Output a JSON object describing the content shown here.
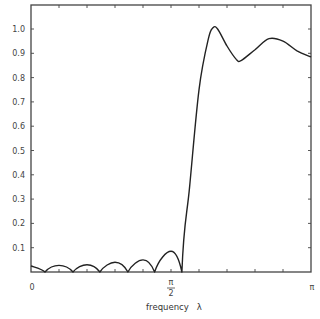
{
  "chart_data": {
    "type": "line",
    "title": "",
    "xlabel": "frequency λ",
    "ylabel": "",
    "xlim": [
      0,
      3.14159
    ],
    "ylim": [
      0,
      1.1
    ],
    "grid": false,
    "legend": null,
    "x_tick_labels": [
      {
        "value": 0,
        "label": "0"
      },
      {
        "value": 1.5708,
        "label": "π/2"
      },
      {
        "value": 3.14159,
        "label": "π"
      }
    ],
    "x_minor_ticks": 10,
    "y_ticks": [
      0.1,
      0.2,
      0.3,
      0.4,
      0.5,
      0.6,
      0.7,
      0.8,
      0.9,
      1.0
    ],
    "y_tick_labels": [
      "0.1",
      "0.2",
      "0.3",
      "0.4",
      "0.5",
      "0.6",
      "0.7",
      "0.8",
      "0.9",
      "1.0"
    ],
    "series": [
      {
        "name": "filter frequency response",
        "x": [
          0,
          0.157,
          0.314,
          0.471,
          0.628,
          0.773,
          0.942,
          1.087,
          1.257,
          1.387,
          1.571,
          1.693,
          1.78,
          1.885,
          1.99,
          2.042,
          2.094,
          2.199,
          2.304,
          2.356,
          2.513,
          2.67,
          2.827,
          2.985,
          3.1416
        ],
        "y": [
          0.025,
          0.0,
          0.027,
          0.0,
          0.03,
          0.0,
          0.04,
          0.0,
          0.05,
          0.0,
          0.085,
          0.0,
          0.35,
          0.75,
          0.96,
          1.005,
          1.0,
          0.93,
          0.875,
          0.87,
          0.915,
          0.96,
          0.95,
          0.91,
          0.885
        ]
      }
    ]
  },
  "labels": {
    "x_zero": "0",
    "x_half_pi_num": "π",
    "x_half_pi_den": "2",
    "x_pi": "π",
    "xlabel": "frequency   λ"
  }
}
